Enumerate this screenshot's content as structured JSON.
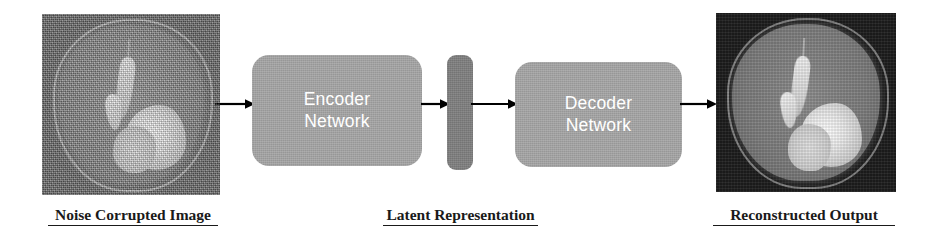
{
  "figure": {
    "background_color": "#ffffff"
  },
  "panels": {
    "input_image": {
      "name": "noise-corrupted-brain-mri",
      "caption": "Noise Corrupted Image",
      "description": "Axial brain MRI slice with heavy speckle noise, bright ventricle and large hyperintense lesion in the lower right hemisphere",
      "background_color": "#6d6d6d"
    },
    "output_image": {
      "name": "reconstructed-brain-mri",
      "caption": "Reconstructed Output",
      "description": "Denoised axial brain MRI slice, same anatomy with clean dark background",
      "background_color": "#1d1d1d"
    }
  },
  "blocks": {
    "encoder": {
      "line1": "Encoder",
      "line2": "Network",
      "fill_color": "#a6a6a6",
      "text_color": "#ffffff"
    },
    "latent": {
      "label": "",
      "caption": "Latent Representation",
      "fill_color": "#7f7f7f"
    },
    "decoder": {
      "line1": "Decoder",
      "line2": "Network",
      "fill_color": "#a6a6a6",
      "text_color": "#ffffff"
    }
  },
  "arrows": [
    {
      "name": "arrow-input-to-encoder",
      "from": "noise-corrupted-brain-mri",
      "to": "encoder",
      "direction": "right",
      "color": "#000000"
    },
    {
      "name": "arrow-encoder-to-latent",
      "from": "encoder",
      "to": "latent",
      "direction": "right",
      "color": "#000000"
    },
    {
      "name": "arrow-latent-to-decoder",
      "from": "latent",
      "to": "decoder",
      "direction": "right",
      "color": "#000000"
    },
    {
      "name": "arrow-decoder-to-output",
      "from": "decoder",
      "to": "reconstructed-brain-mri",
      "direction": "right",
      "color": "#000000"
    }
  ],
  "captions": {
    "input": "Noise Corrupted Image",
    "latent": "Latent Representation",
    "output": "Reconstructed Output"
  }
}
